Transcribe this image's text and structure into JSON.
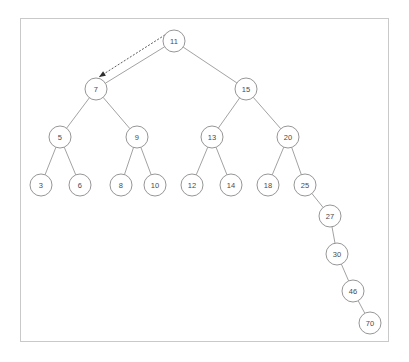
{
  "figure": {
    "frame": {
      "x": 20,
      "y": 18,
      "width": 369,
      "height": 324,
      "border_color": "#c9c9c9"
    },
    "background_color": "#ffffff",
    "node_stroke_color": "#8a8a8a",
    "node_fill_color": "#ffffff",
    "label_color": "#4a4a4a",
    "edge_color": "#8a8a8a",
    "pointer_color": "#2e2e2e",
    "node_radius": 11
  },
  "chart_data": {
    "type": "diagram",
    "subtype": "binary-search-tree",
    "node_radius": 11,
    "nodes": [
      {
        "id": "n11",
        "label": "11",
        "x": 174,
        "y": 41,
        "depth": 0
      },
      {
        "id": "n7",
        "label": "7",
        "x": 96,
        "y": 89,
        "depth": 1
      },
      {
        "id": "n15",
        "label": "15",
        "x": 246,
        "y": 89,
        "depth": 1
      },
      {
        "id": "n5",
        "label": "5",
        "x": 60,
        "y": 137,
        "depth": 2
      },
      {
        "id": "n9",
        "label": "9",
        "x": 137,
        "y": 137,
        "depth": 2
      },
      {
        "id": "n13",
        "label": "13",
        "x": 212,
        "y": 137,
        "depth": 2
      },
      {
        "id": "n20",
        "label": "20",
        "x": 288,
        "y": 137,
        "depth": 2
      },
      {
        "id": "n3",
        "label": "3",
        "x": 41,
        "y": 185,
        "depth": 3
      },
      {
        "id": "n6",
        "label": "6",
        "x": 80,
        "y": 185,
        "depth": 3
      },
      {
        "id": "n8",
        "label": "8",
        "x": 121,
        "y": 185,
        "depth": 3
      },
      {
        "id": "n10",
        "label": "10",
        "x": 155,
        "y": 185,
        "depth": 3
      },
      {
        "id": "n12",
        "label": "12",
        "x": 192,
        "y": 185,
        "depth": 3
      },
      {
        "id": "n14",
        "label": "14",
        "x": 231,
        "y": 185,
        "depth": 3
      },
      {
        "id": "n18",
        "label": "18",
        "x": 268,
        "y": 185,
        "depth": 3
      },
      {
        "id": "n25",
        "label": "25",
        "x": 305,
        "y": 185,
        "depth": 3
      },
      {
        "id": "n27",
        "label": "27",
        "x": 330,
        "y": 216,
        "depth": 4
      },
      {
        "id": "n30",
        "label": "30",
        "x": 337,
        "y": 254,
        "depth": 5
      },
      {
        "id": "n46",
        "label": "46",
        "x": 353,
        "y": 291,
        "depth": 6
      },
      {
        "id": "n70",
        "label": "70",
        "x": 370,
        "y": 323,
        "depth": 7
      }
    ],
    "edges": [
      {
        "from": "n11",
        "to": "n7"
      },
      {
        "from": "n11",
        "to": "n15"
      },
      {
        "from": "n7",
        "to": "n5"
      },
      {
        "from": "n7",
        "to": "n9"
      },
      {
        "from": "n15",
        "to": "n13"
      },
      {
        "from": "n15",
        "to": "n20"
      },
      {
        "from": "n5",
        "to": "n3"
      },
      {
        "from": "n5",
        "to": "n6"
      },
      {
        "from": "n9",
        "to": "n8"
      },
      {
        "from": "n9",
        "to": "n10"
      },
      {
        "from": "n13",
        "to": "n12"
      },
      {
        "from": "n13",
        "to": "n14"
      },
      {
        "from": "n20",
        "to": "n18"
      },
      {
        "from": "n20",
        "to": "n25"
      },
      {
        "from": "n25",
        "to": "n27"
      },
      {
        "from": "n27",
        "to": "n30"
      },
      {
        "from": "n30",
        "to": "n46"
      },
      {
        "from": "n46",
        "to": "n70"
      }
    ],
    "annotations": [
      {
        "id": "pointer-11-to-7",
        "style": "dashed-arrow",
        "from_x": 168,
        "from_y": 33,
        "to_x": 99,
        "to_y": 77,
        "description": "dashed arrow from node 11 to node 7"
      }
    ]
  }
}
